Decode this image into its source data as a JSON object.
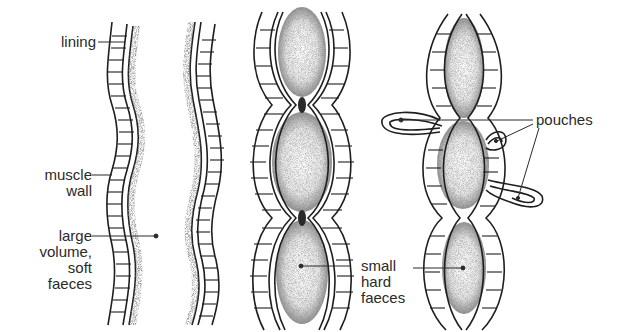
{
  "diagram": {
    "panels": [
      {
        "id": "panel-1",
        "description": "Colon wall segment with lining and muscle wall, large volume soft faeces"
      },
      {
        "id": "panel-2",
        "description": "Opposite wall of the same colon segment"
      },
      {
        "id": "panel-3",
        "description": "Constricted colon with small hard faeces"
      },
      {
        "id": "panel-4",
        "description": "Colon with pouches herniating through muscle wall"
      }
    ],
    "labels": {
      "lining": "lining",
      "muscle_wall": "muscle\nwall",
      "large_volume": "large\nvolume,\nsoft\nfaeces",
      "small_hard": "small\nhard\nfaeces",
      "pouches": "pouches"
    },
    "colors": {
      "ink": "#1e1e1e",
      "background": "#ffffff",
      "stipple": "#555555"
    }
  }
}
